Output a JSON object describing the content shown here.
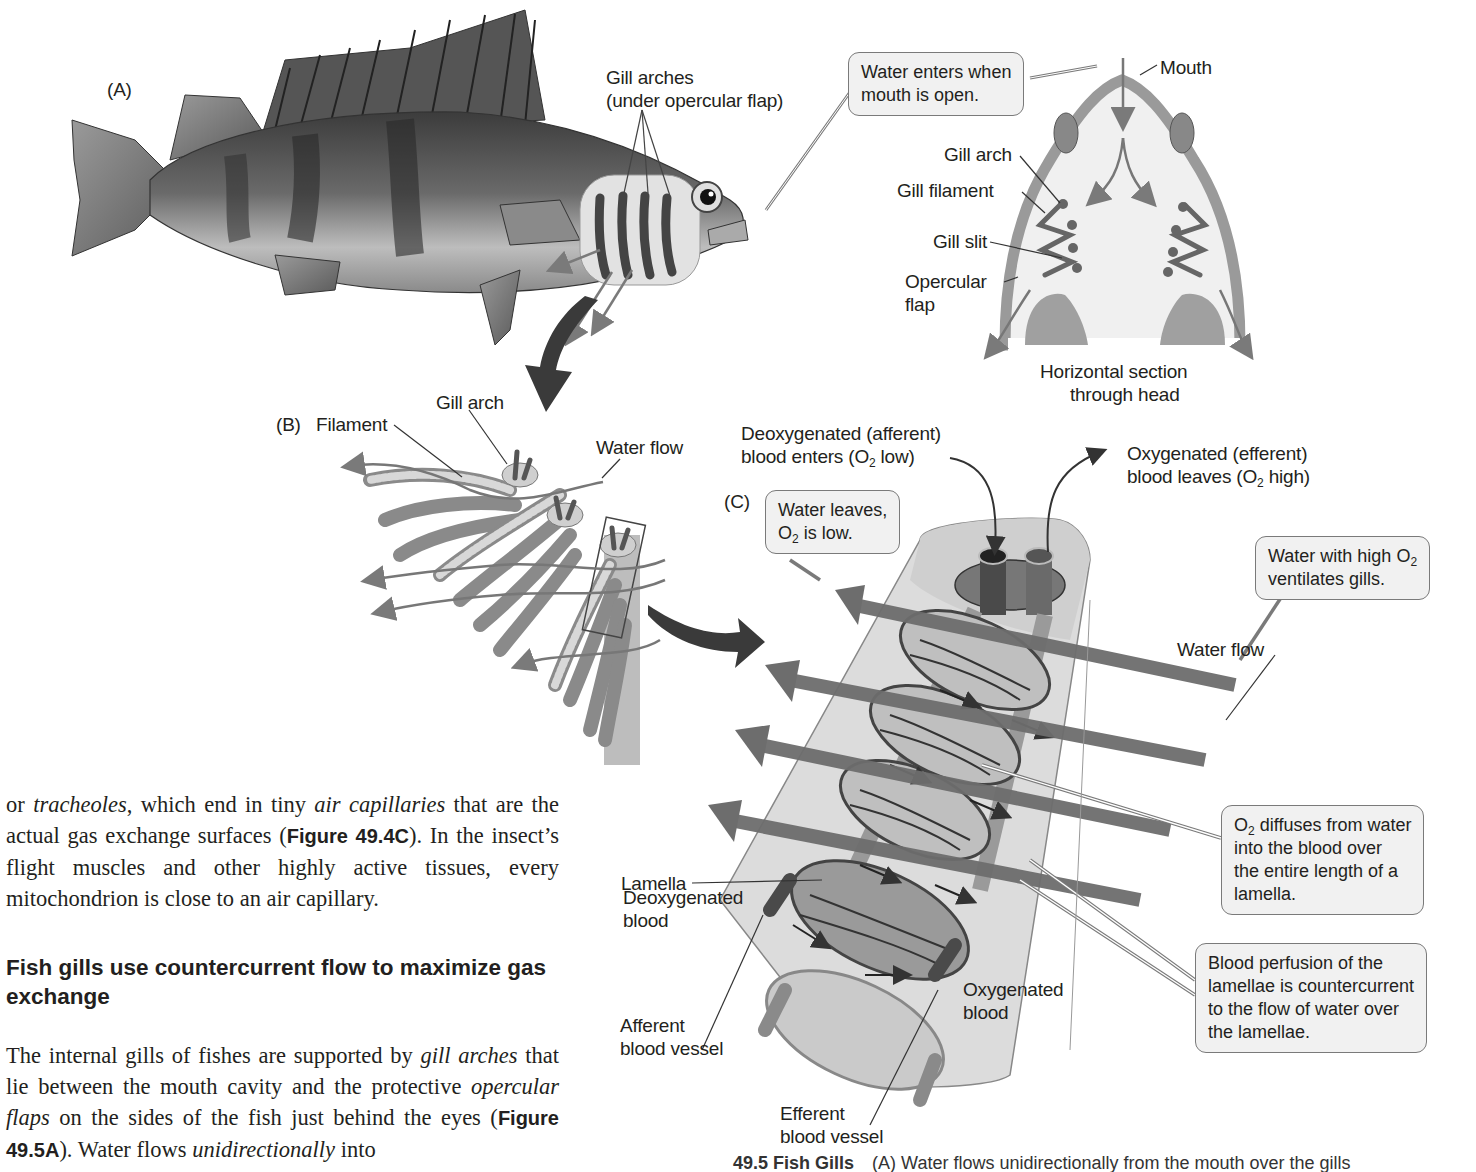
{
  "figure": {
    "panel_a": {
      "label": "(A)",
      "gill_arches_line1": "Gill arches",
      "gill_arches_line2": "(under opercular flap)",
      "callout_water_enters_line1": "Water enters when",
      "callout_water_enters_line2": "mouth is open.",
      "mouth": "Mouth",
      "gill_arch": "Gill arch",
      "gill_filament": "Gill filament",
      "gill_slit": "Gill slit",
      "opercular_line1": "Opercular",
      "opercular_line2": "flap",
      "section_line1": "Horizontal section",
      "section_line2": "through head"
    },
    "panel_b": {
      "label": "(B)",
      "filament": "Filament",
      "gill_arch": "Gill arch",
      "water_flow": "Water flow"
    },
    "panel_c": {
      "label": "(C)",
      "deoxy_line1": "Deoxygenated (afferent)",
      "deoxy_line2_pre": "blood enters (O",
      "deoxy_line2_sub": "2",
      "deoxy_line2_post": " low)",
      "oxy_line1": "Oxygenated (efferent)",
      "oxy_line2_pre": "blood leaves (O",
      "oxy_line2_sub": "2",
      "oxy_line2_post": " high)",
      "water_leaves_line1": "Water leaves,",
      "water_leaves_line2_pre": "O",
      "water_leaves_line2_sub": "2",
      "water_leaves_line2_post": " is low.",
      "water_high_line1_pre": "Water with high O",
      "water_high_line1_sub": "2",
      "water_high_line2": "ventilates gills.",
      "water_flow": "Water flow",
      "lamella": "Lamella",
      "deoxygenated_blood_line1": "Deoxygenated",
      "deoxygenated_blood_line2": "blood",
      "oxygenated_blood_line1": "Oxygenated",
      "oxygenated_blood_line2": "blood",
      "afferent_line1": "Afferent",
      "afferent_line2": "blood vessel",
      "efferent_line1": "Efferent",
      "efferent_line2": "blood vessel",
      "diffuse_line1_pre": "O",
      "diffuse_line1_sub": "2",
      "diffuse_line1_post": " diffuses from water",
      "diffuse_line2": "into the blood over",
      "diffuse_line3": "the entire length of a",
      "diffuse_line4": "lamella.",
      "perfusion_line1": "Blood perfusion of the",
      "perfusion_line2": "lamellae is countercurrent",
      "perfusion_line3": "to the flow of water over",
      "perfusion_line4": "the lamellae."
    },
    "caption": {
      "number": "49.5  Fish Gills",
      "text": "(A) Water flows unidirectionally from the mouth over the gills"
    }
  },
  "text": {
    "para1": {
      "s1": "or ",
      "i1": "tracheoles",
      "s2": ", which end in tiny ",
      "i2": "air capillaries",
      "s3": " that are the actual gas exchange surfaces (",
      "b1": "Figure 49.4C",
      "s4": "). In the insect’s flight muscles and other highly active tissues, every mitochondrion is close to an air capillary."
    },
    "heading": "Fish gills use countercurrent flow to maximize gas exchange",
    "para2": {
      "s1": "The internal gills of fishes are supported by ",
      "i1": "gill arches",
      "s2": " that lie between the mouth cavity and the protective ",
      "i2": "opercular flaps",
      "s3": " on the sides of the fish just behind the eyes (",
      "b1": "Figure 49.5A",
      "s4": "). Water flows ",
      "i3": "unidirectionally",
      "s5": " into"
    }
  },
  "colors": {
    "ink": "#231f20",
    "callout_fill": "#f1f1f1",
    "callout_border": "#7a7a7a",
    "arrow_gray": "#6d6d6d",
    "dark_arrow": "#3a3a3a",
    "vessel_dark": "#4a4a4a",
    "tissue_light": "#d8d8d8"
  }
}
